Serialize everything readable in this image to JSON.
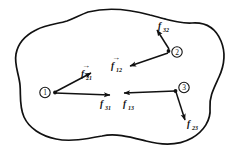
{
  "figure": {
    "type": "free-body-force-diagram",
    "background_color": "#ffffff",
    "line_color": "#111111",
    "boundary": {
      "name": "system-boundary-blob",
      "style": "closed irregular curve"
    },
    "nodes": [
      {
        "id": "1",
        "label": "1",
        "marker": "circled-number",
        "x": 48,
        "y": 92
      },
      {
        "id": "2",
        "label": "2",
        "marker": "circled-number",
        "x": 172,
        "y": 52
      },
      {
        "id": "3",
        "label": "3",
        "marker": "circled-number",
        "x": 178,
        "y": 88
      }
    ],
    "vectors": [
      {
        "name": "f21",
        "base": "f",
        "subscript": "21",
        "has_vector_hat": true,
        "from_node": "1",
        "to_direction": "upper-right",
        "label_x": 82,
        "label_y": 72
      },
      {
        "name": "f31",
        "base": "f",
        "subscript": "31",
        "has_vector_hat": false,
        "from_node": "1",
        "to_direction": "right",
        "label_x": 101,
        "label_y": 105
      },
      {
        "name": "f32",
        "base": "f",
        "subscript": "32",
        "has_vector_hat": true,
        "from_node": "2",
        "to_direction": "up-left",
        "label_x": 158,
        "label_y": 25
      },
      {
        "name": "f12",
        "base": "f",
        "subscript": "12",
        "has_vector_hat": true,
        "from_node": "2",
        "to_direction": "down-left",
        "label_x": 112,
        "label_y": 65
      },
      {
        "name": "f13",
        "base": "f",
        "subscript": "13",
        "has_vector_hat": false,
        "from_node": "3",
        "to_direction": "left",
        "label_x": 124,
        "label_y": 105
      },
      {
        "name": "f23",
        "base": "f",
        "subscript": "23",
        "has_vector_hat": false,
        "from_node": "3",
        "to_direction": "down-right",
        "label_x": 184,
        "label_y": 127
      }
    ]
  }
}
